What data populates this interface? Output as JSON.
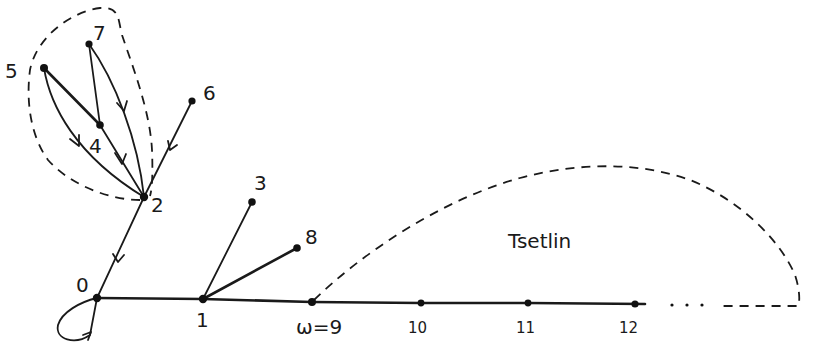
{
  "diagram": {
    "type": "directed graph (hand-drawn)",
    "region_label": "Tsetlin",
    "ellipsis": ". . .",
    "nodes": [
      {
        "id": "0",
        "label": "0",
        "x": 97,
        "y": 298
      },
      {
        "id": "1",
        "label": "1",
        "x": 203,
        "y": 299
      },
      {
        "id": "2",
        "label": "2",
        "x": 144,
        "y": 197
      },
      {
        "id": "3",
        "label": "3",
        "x": 252,
        "y": 202
      },
      {
        "id": "4",
        "label": "4",
        "x": 100,
        "y": 125
      },
      {
        "id": "5",
        "label": "5",
        "x": 44,
        "y": 68
      },
      {
        "id": "6",
        "label": "6",
        "x": 192,
        "y": 101
      },
      {
        "id": "7",
        "label": "7",
        "x": 89,
        "y": 44
      },
      {
        "id": "8",
        "label": "8",
        "x": 297,
        "y": 248
      },
      {
        "id": "9",
        "label": "ω=9",
        "x": 312,
        "y": 302
      },
      {
        "id": "10",
        "label": "10",
        "x": 421,
        "y": 303
      },
      {
        "id": "11",
        "label": "11",
        "x": 528,
        "y": 303
      },
      {
        "id": "12",
        "label": "12",
        "x": 635,
        "y": 304
      }
    ],
    "edges": [
      {
        "from": "0",
        "to": "0",
        "directed": true,
        "kind": "self-loop"
      },
      {
        "from": "2",
        "to": "0",
        "directed": true
      },
      {
        "from": "6",
        "to": "2",
        "directed": true
      },
      {
        "from": "5",
        "to": "4",
        "directed": false
      },
      {
        "from": "7",
        "to": "4",
        "directed": false
      },
      {
        "from": "4",
        "to": "2",
        "directed": true
      },
      {
        "from": "5",
        "to": "2",
        "directed": true,
        "kind": "curved"
      },
      {
        "from": "7",
        "to": "2",
        "directed": true,
        "kind": "curved"
      },
      {
        "from": "0",
        "to": "1",
        "directed": false
      },
      {
        "from": "1",
        "to": "3",
        "directed": false
      },
      {
        "from": "1",
        "to": "8",
        "directed": false
      },
      {
        "from": "1",
        "to": "9",
        "directed": false
      },
      {
        "from": "9",
        "to": "10",
        "directed": false
      },
      {
        "from": "10",
        "to": "11",
        "directed": false
      },
      {
        "from": "11",
        "to": "12",
        "directed": false
      }
    ],
    "dashed_regions": [
      {
        "name": "cluster-2-4-5-7",
        "encloses": [
          "2",
          "4",
          "5",
          "7"
        ]
      },
      {
        "name": "tsetlin-region",
        "encloses": [
          "9",
          "10",
          "11",
          "12",
          "..."
        ],
        "label": "Tsetlin"
      }
    ]
  }
}
